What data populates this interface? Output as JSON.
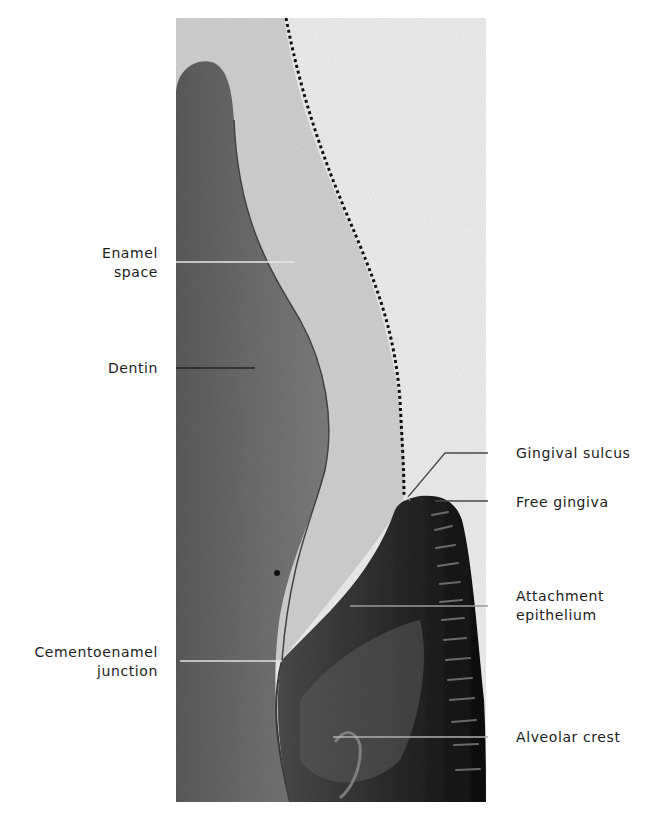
{
  "figure": {
    "colors": {
      "background": "#ffffff",
      "enamel_space": "#c9c9c9",
      "dentin": "#6e6e6e",
      "gingiva": "#1e1e1e",
      "leader_line": "#555555"
    }
  },
  "labels": {
    "enamel_space": {
      "line1": "Enamel",
      "line2": "space"
    },
    "dentin": {
      "line1": "Dentin"
    },
    "cementoenamel_junction": {
      "line1": "Cementoenamel",
      "line2": "junction"
    },
    "gingival_sulcus": {
      "line1": "Gingival sulcus"
    },
    "free_gingiva": {
      "line1": "Free gingiva"
    },
    "attachment_epithelium": {
      "line1": "Attachment",
      "line2": "epithelium"
    },
    "alveolar_crest": {
      "line1": "Alveolar crest"
    }
  }
}
